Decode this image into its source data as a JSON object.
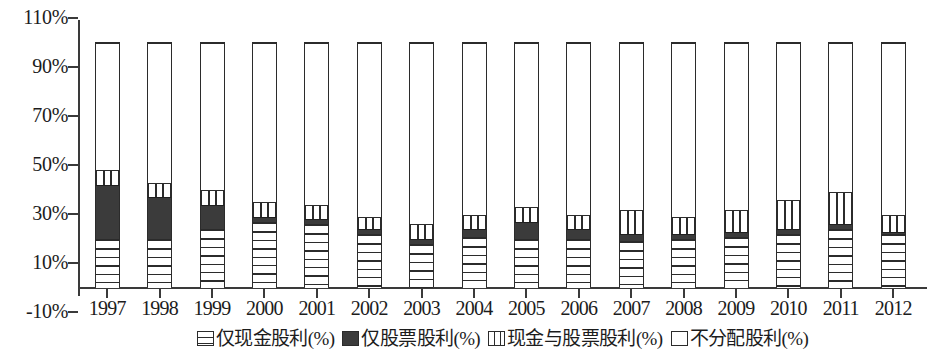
{
  "chart_data": {
    "type": "bar",
    "stacked": true,
    "title": "",
    "subtitle": "",
    "xlabel": "",
    "ylabel": "",
    "grid": false,
    "legend_position": "bottom",
    "ylim": [
      -10,
      110
    ],
    "ytick_labels": [
      "110%",
      "90%",
      "70%",
      "50%",
      "30%",
      "10%",
      "-10%"
    ],
    "ytick_values": [
      110,
      90,
      70,
      50,
      30,
      10,
      -10
    ],
    "categories": [
      "1997",
      "1998",
      "1999",
      "2000",
      "2001",
      "2002",
      "2003",
      "2004",
      "2005",
      "2006",
      "2007",
      "2008",
      "2009",
      "2010",
      "2011",
      "2012"
    ],
    "series": [
      {
        "name": "仅现金股利(%)",
        "pattern": "horizontal-hatch",
        "color": "#ffffff",
        "values": [
          20,
          20,
          24,
          27,
          26,
          22,
          18,
          21,
          20,
          20,
          19,
          20,
          21,
          22,
          24,
          22
        ]
      },
      {
        "name": "仅股票股利(%)",
        "pattern": "solid-dark",
        "color": "#3b3b3b",
        "values": [
          22,
          17,
          10,
          2,
          2,
          2,
          2,
          3,
          7,
          4,
          3,
          2,
          2,
          2,
          2,
          1
        ]
      },
      {
        "name": "现金与股票股利(%)",
        "pattern": "vertical-hatch",
        "color": "#ffffff",
        "values": [
          6,
          6,
          6,
          6,
          6,
          5,
          6,
          6,
          6,
          6,
          10,
          7,
          9,
          12,
          13,
          7
        ]
      },
      {
        "name": "不分配股利(%)",
        "pattern": "empty",
        "color": "#ffffff",
        "values": [
          52,
          57,
          60,
          65,
          66,
          71,
          74,
          70,
          67,
          70,
          68,
          71,
          68,
          64,
          61,
          70
        ]
      }
    ]
  },
  "legend": {
    "items": [
      {
        "label": "仅现金股利(%)",
        "swatch": "horizontal-hatch-swatch"
      },
      {
        "label": "仅股票股利(%)",
        "swatch": "solid-dark-swatch"
      },
      {
        "label": "现金与股票股利(%)",
        "swatch": "vertical-hatch-swatch"
      },
      {
        "label": "不分配股利(%)",
        "swatch": "empty-swatch"
      }
    ]
  }
}
